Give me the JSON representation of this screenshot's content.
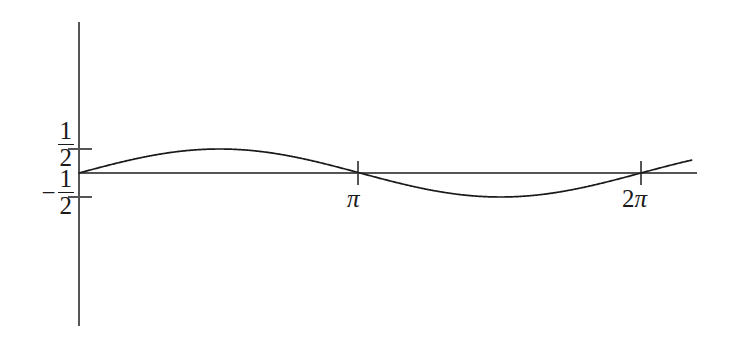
{
  "figure": {
    "title": "",
    "background_color": "#ffffff",
    "axis_color": "#555555",
    "curve_color": "#1a1a1a",
    "label_color": "#1a1a1a",
    "width": 737,
    "height": 337
  },
  "axes": {
    "y_axis": {
      "name": "y-axis",
      "x": 79,
      "y_top": 22,
      "y_bottom": 326
    },
    "x_axis": {
      "name": "x-axis",
      "y": 173,
      "x_left": 79,
      "x_right": 697
    },
    "origin": {
      "x": 79,
      "y": 173
    }
  },
  "y_ticks": [
    {
      "label_num": "1",
      "label_den": "2",
      "sign": "",
      "value": 0.5,
      "pixel_y": 149
    },
    {
      "label_num": "1",
      "label_den": "2",
      "sign": "−",
      "value": -0.5,
      "pixel_y": 197
    }
  ],
  "x_ticks": [
    {
      "label": "π",
      "lead": "",
      "value": 3.14159,
      "pixel_x": 358
    },
    {
      "label": "π",
      "lead": "2",
      "value": 6.28319,
      "pixel_x": 641
    }
  ],
  "labels": {
    "half": {
      "numerator": "1",
      "denominator": "2"
    },
    "neg_half": {
      "sign": "−",
      "numerator": "1",
      "denominator": "2"
    },
    "pi": {
      "lead": "",
      "glyph": "π"
    },
    "two_pi": {
      "lead": "2",
      "glyph": "π"
    }
  },
  "chart_data": {
    "type": "line",
    "title": "",
    "xlabel": "",
    "ylabel": "",
    "xlim": [
      0,
      6.8482
    ],
    "ylim": [
      -1.72,
      1.72
    ],
    "grid": false,
    "legend": null,
    "series": [
      {
        "name": "sin(x)/2",
        "expression": "y = (1/2)·sin(x)",
        "amplitude": 0.5,
        "period": 6.28319,
        "phase": 0,
        "color": "#1a1a1a",
        "x": [
          0,
          0.3927,
          0.7854,
          1.1781,
          1.5708,
          1.9635,
          2.3562,
          2.7489,
          3.14159,
          3.5343,
          3.927,
          4.3197,
          4.7124,
          5.1051,
          5.4978,
          5.8905,
          6.28319,
          6.6759,
          6.8482
        ],
        "y": [
          0,
          0.1913,
          0.3536,
          0.4619,
          0.5,
          0.4619,
          0.3536,
          0.1913,
          0,
          -0.1913,
          -0.3536,
          -0.4619,
          -0.5,
          -0.4619,
          -0.3536,
          -0.1913,
          0,
          0.1913,
          0.2612
        ]
      }
    ],
    "key_points": {
      "maximum": {
        "x": 1.5708,
        "y": 0.5,
        "pixel_x": 220,
        "pixel_y": 149
      },
      "minimum": {
        "x": 4.7124,
        "y": -0.5,
        "pixel_x": 500,
        "pixel_y": 197
      },
      "zero_crossings": [
        {
          "x": 0,
          "pixel_x": 79
        },
        {
          "x": 3.14159,
          "pixel_x": 358
        },
        {
          "x": 6.28319,
          "pixel_x": 641
        }
      ]
    }
  }
}
